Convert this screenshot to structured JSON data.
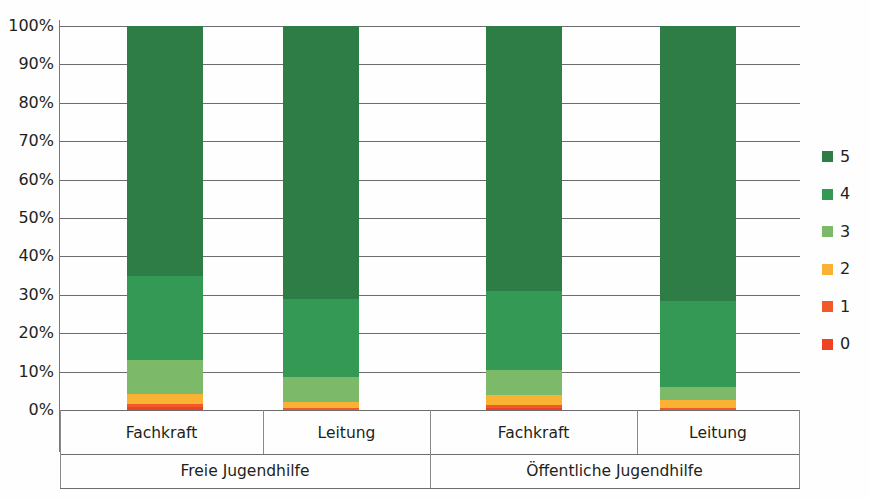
{
  "chart_data": {
    "type": "bar",
    "subtype": "stacked-100-percent",
    "title": "",
    "xlabel": "",
    "ylabel": "",
    "ylim": [
      0,
      100
    ],
    "grid": true,
    "legend_position": "right",
    "categories": [
      "Fachkraft",
      "Leitung",
      "Fachkraft",
      "Leitung"
    ],
    "groups": [
      {
        "label": "Freie Jugendhilfe",
        "categories": [
          "Fachkraft",
          "Leitung"
        ]
      },
      {
        "label": "Öffentliche Jugendhilfe",
        "categories": [
          "Fachkraft",
          "Leitung"
        ]
      }
    ],
    "series": [
      {
        "name": "0",
        "color": "#ef4123",
        "values": [
          0.8,
          0.0,
          0.6,
          0.0
        ]
      },
      {
        "name": "1",
        "color": "#f05a28",
        "values": [
          0.7,
          0.6,
          0.8,
          0.5
        ]
      },
      {
        "name": "2",
        "color": "#f9b233",
        "values": [
          2.7,
          1.4,
          2.6,
          2.0
        ]
      },
      {
        "name": "3",
        "color": "#7cba6a",
        "values": [
          8.8,
          6.5,
          6.3,
          3.5
        ]
      },
      {
        "name": "4",
        "color": "#339955",
        "values": [
          22.0,
          20.5,
          20.7,
          22.5
        ]
      },
      {
        "name": "5",
        "color": "#2e7d46",
        "values": [
          65.0,
          71.0,
          69.0,
          71.5
        ]
      }
    ],
    "y_ticks": [
      "0%",
      "10%",
      "20%",
      "30%",
      "40%",
      "50%",
      "60%",
      "70%",
      "80%",
      "90%",
      "100%"
    ],
    "legend_entries": [
      "5",
      "4",
      "3",
      "2",
      "1",
      "0"
    ]
  },
  "colors": {
    "axis": "#6d6d6d",
    "text": "#231f20",
    "background": "#ffffff"
  }
}
